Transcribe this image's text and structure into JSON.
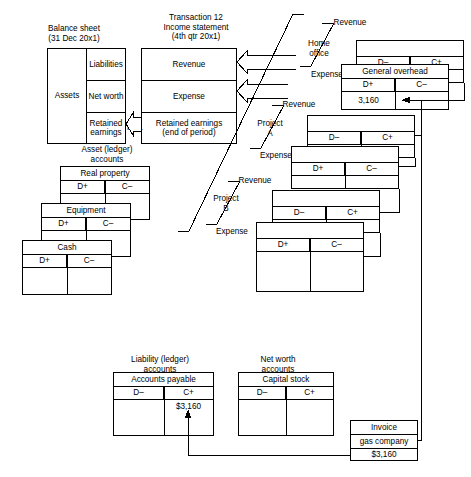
{
  "diagram": {
    "title_balance_sheet": [
      "Balance sheet",
      "(31 Dec 20x1)"
    ],
    "title_income_statement": [
      "Transaction 12",
      "Income statement",
      "(4th qtr 20x1)"
    ],
    "title_asset_accounts": [
      "Asset (ledger)",
      "accounts"
    ],
    "title_liability_accounts": [
      "Liability (ledger)",
      "accounts"
    ],
    "title_networth_accounts": [
      "Net worth",
      "accounts"
    ]
  },
  "balance_sheet": {
    "assets": "Assets",
    "liabilities": "Liabilities",
    "net_worth": "Net worth",
    "retained_earnings": [
      "Retained",
      "earnings"
    ]
  },
  "income_statement": {
    "revenue": "Revenue",
    "expense": "Expense",
    "retained_earnings": [
      "Retained earnings",
      "(end of period)"
    ]
  },
  "connectors": {
    "re_label": "R.E.",
    "revenue_label": "Revenue",
    "expense_label": "Expense"
  },
  "segments": [
    {
      "name": "Home office",
      "name_lines": [
        "Home",
        "office"
      ],
      "revenue_label": "Revenue",
      "expense_label": "Expense",
      "revenue_account": {
        "title": "",
        "debit": "D–",
        "credit": "C+",
        "debit_value": "",
        "credit_value": ""
      },
      "expense_account": {
        "title": "General overhead",
        "debit": "D+",
        "credit": "C–",
        "debit_value": "3,160",
        "credit_value": ""
      }
    },
    {
      "name": "Project A",
      "name_lines": [
        "Project",
        "A"
      ],
      "revenue_label": "Revenue",
      "expense_label": "Expense",
      "revenue_account": {
        "title": "",
        "debit": "D–",
        "credit": "C+",
        "debit_value": "",
        "credit_value": ""
      },
      "expense_account": {
        "title": "",
        "debit": "D+",
        "credit": "C–",
        "debit_value": "",
        "credit_value": ""
      }
    },
    {
      "name": "Project B",
      "name_lines": [
        "Project",
        "B"
      ],
      "revenue_label": "Revenue",
      "expense_label": "Expense",
      "revenue_account": {
        "title": "",
        "debit": "D–",
        "credit": "C+",
        "debit_value": "",
        "credit_value": ""
      },
      "expense_account": {
        "title": "",
        "debit": "D+",
        "credit": "C–",
        "debit_value": "",
        "credit_value": ""
      }
    }
  ],
  "asset_accounts": [
    {
      "title": "Real property",
      "debit": "D+",
      "credit": "C–",
      "debit_value": "",
      "credit_value": ""
    },
    {
      "title": "Equipment",
      "debit": "D+",
      "credit": "C–",
      "debit_value": "",
      "credit_value": ""
    },
    {
      "title": "Cash",
      "debit": "D+",
      "credit": "C–",
      "debit_value": "",
      "credit_value": ""
    }
  ],
  "liability_accounts": [
    {
      "title": "Accounts payable",
      "debit": "D–",
      "credit": "C+",
      "debit_value": "",
      "credit_value": "$3,160"
    }
  ],
  "networth_accounts": [
    {
      "title": "Capital stock",
      "debit": "D–",
      "credit": "C+",
      "debit_value": "",
      "credit_value": ""
    }
  ],
  "invoice": {
    "line1": "Invoice",
    "line2": "gas company",
    "line3": "$3,160"
  }
}
